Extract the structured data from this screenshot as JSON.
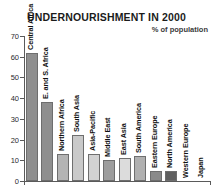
{
  "chart_data": {
    "type": "bar",
    "title": "UNDERNOURISHMENT IN 2000",
    "subtitle": "% of population",
    "xlabel": "",
    "ylabel": "",
    "ylim": [
      0,
      70
    ],
    "yticks": [
      0,
      10,
      20,
      30,
      40,
      50,
      60,
      70
    ],
    "ytick_labels": [
      "0",
      "10",
      "20",
      "30",
      "40",
      "50",
      "60",
      "70"
    ],
    "grid": false,
    "legend": false,
    "categories": [
      "Central Africa",
      "E. and S. Africa",
      "Northern Africa",
      "South Asia",
      "Asia-Pacific",
      "Middle East",
      "East Asia",
      "South America",
      "Eastern Europe",
      "North America",
      "Western Europe",
      "Japan"
    ],
    "values": [
      62,
      38,
      13,
      22,
      13,
      10,
      11,
      12,
      5,
      5,
      0,
      0
    ],
    "bar_colors": [
      "#8f8f8f",
      "#8f8f8f",
      "#b4b4b4",
      "#c9c9c9",
      "#d2d2d2",
      "#9d9d9d",
      "#dcdcdc",
      "#b0b0b0",
      "#8a8a8a",
      "#5f5f5f",
      "#ffffff",
      "#ffffff"
    ]
  },
  "axis": {
    "line_color": "#5a5a5a"
  }
}
